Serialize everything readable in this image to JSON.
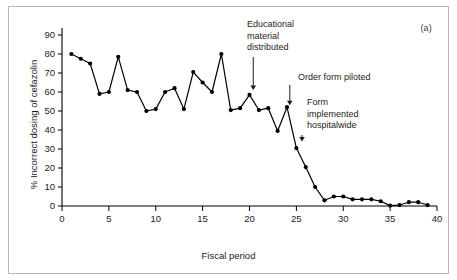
{
  "panel": {
    "label": "(a)"
  },
  "chart_data": {
    "type": "line",
    "title": "",
    "xlabel": "Fiscal period",
    "ylabel": "% Incorrect dosing of cefazolin",
    "xlim": [
      0,
      40
    ],
    "ylim": [
      0,
      90
    ],
    "xticks": [
      0,
      5,
      10,
      15,
      20,
      25,
      30,
      35,
      40
    ],
    "yticks": [
      0,
      10,
      20,
      30,
      40,
      50,
      60,
      70,
      80,
      90
    ],
    "grid": false,
    "legend": null,
    "marker": "filled-circle",
    "line_color": "#000000",
    "x": [
      1,
      2,
      3,
      4,
      5,
      6,
      7,
      8,
      9,
      10,
      11,
      12,
      13,
      14,
      15,
      16,
      17,
      18,
      19,
      20,
      21,
      22,
      23,
      24,
      25,
      26,
      27,
      28,
      29,
      30,
      31,
      32,
      33,
      34,
      35,
      36,
      37,
      38,
      39
    ],
    "values": [
      80,
      77.5,
      75,
      59,
      60,
      78.5,
      61,
      60,
      50,
      51,
      60,
      62,
      51,
      70.5,
      65,
      60,
      80,
      50.5,
      51.5,
      58.5,
      50.5,
      51.5,
      39.5,
      52,
      30.5,
      20.5,
      10,
      3,
      5,
      5,
      3.5,
      3.5,
      3.5,
      2.5,
      0.2,
      0.5,
      2,
      2,
      0.5
    ],
    "annotations": [
      {
        "text": "Educational\nmaterial\ndistributed",
        "x": 20.4,
        "y": 61
      },
      {
        "text": "Order form piloted",
        "x": 24.3,
        "y": 53
      },
      {
        "text": "Form\nimplemented\nhospitalwide",
        "x": 25.6,
        "y": 34
      }
    ]
  }
}
